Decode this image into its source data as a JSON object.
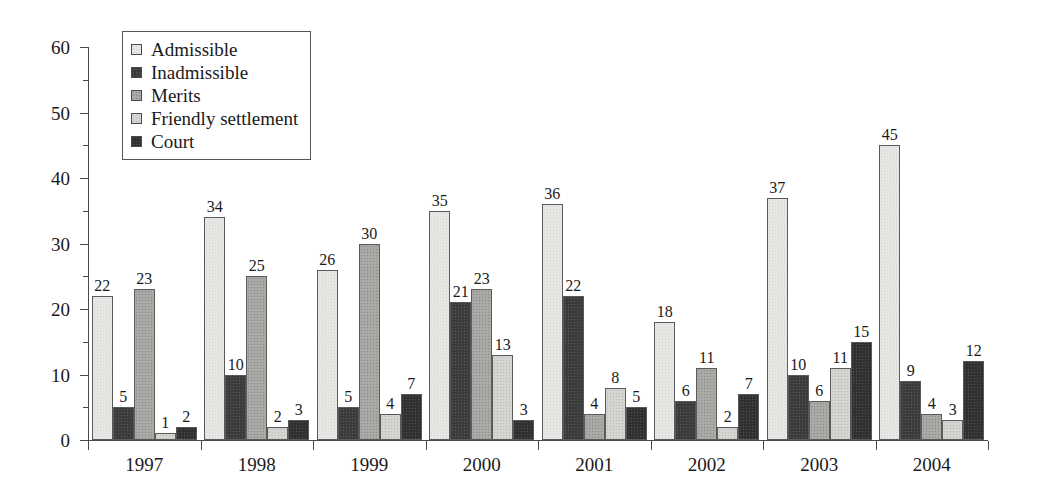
{
  "chart_data": {
    "type": "bar",
    "title": "",
    "subtitle": "",
    "xlabel": "",
    "ylabel": "",
    "categories": [
      "1997",
      "1998",
      "1999",
      "2000",
      "2001",
      "2002",
      "2003",
      "2004"
    ],
    "series": [
      {
        "name": "Admissible",
        "color": "#e8e8e6",
        "values": [
          22,
          34,
          26,
          35,
          36,
          18,
          37,
          45
        ]
      },
      {
        "name": "Inadmissible",
        "color": "#3e3e3e",
        "values": [
          5,
          10,
          5,
          21,
          22,
          6,
          10,
          9
        ]
      },
      {
        "name": "Merits",
        "color": "#a6a6a2",
        "values": [
          23,
          25,
          30,
          23,
          4,
          11,
          6,
          4
        ]
      },
      {
        "name": "Friendly settlement",
        "color": "#d2d2ce",
        "values": [
          1,
          2,
          4,
          13,
          8,
          2,
          11,
          3
        ]
      },
      {
        "name": "Court",
        "color": "#333333",
        "values": [
          2,
          3,
          7,
          3,
          5,
          7,
          15,
          12
        ]
      }
    ],
    "ylim": [
      0,
      60
    ],
    "yticks": [
      0,
      10,
      20,
      30,
      40,
      50,
      60
    ],
    "yticks_minor": [
      5,
      15,
      25,
      35,
      45,
      55
    ],
    "grid": false,
    "legend_position": "top-left",
    "show_value_labels": true
  },
  "legend": {
    "items": [
      {
        "label": "Admissible"
      },
      {
        "label": "Inadmissible"
      },
      {
        "label": "Merits"
      },
      {
        "label": "Friendly settlement"
      },
      {
        "label": "Court"
      }
    ]
  }
}
